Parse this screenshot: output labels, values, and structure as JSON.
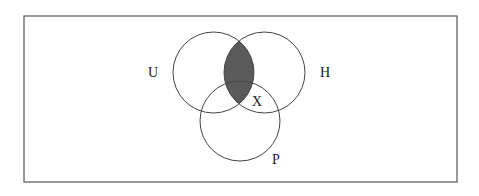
{
  "diagram": {
    "type": "venn",
    "frame": {
      "x": 24,
      "y": 16,
      "width": 433,
      "height": 166,
      "stroke": "#555555"
    },
    "sets": [
      {
        "id": "U",
        "label": "U",
        "cx": 213.5,
        "cy": 72.5,
        "r": 40.5,
        "label_x": 148,
        "label_y": 77
      },
      {
        "id": "H",
        "label": "H",
        "cx": 264.5,
        "cy": 72.5,
        "r": 40.5,
        "label_x": 320,
        "label_y": 77
      },
      {
        "id": "P",
        "label": "P",
        "cx": 240,
        "cy": 121,
        "r": 40,
        "label_x": 272,
        "label_y": 164
      }
    ],
    "region_label": {
      "text": "X",
      "x": 252,
      "y": 106
    },
    "shaded_region": {
      "description": "U ∩ H",
      "color": "#5a5a5a"
    },
    "stroke_color": "#444444"
  }
}
